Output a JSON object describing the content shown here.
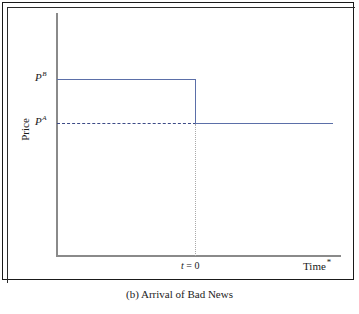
{
  "figure": {
    "caption": "(b) Arrival of Bad News",
    "frame_color": "#1a1a1a"
  },
  "axes": {
    "ylabel": "Price",
    "xlabel": "Time",
    "xlabel_superscript": "*",
    "axis_color": "#8a8a8a"
  },
  "labels": {
    "p_high_base": "P",
    "p_high_sup": "B",
    "p_low_base": "P",
    "p_low_sup": "A",
    "event_var": "t",
    "event_eq": " = 0"
  },
  "chart_data": {
    "type": "line",
    "title": "(b) Arrival of Bad News",
    "xlabel": "Time*",
    "ylabel": "Price",
    "grid": false,
    "legend": null,
    "xlim": [
      0,
      1
    ],
    "ylim": [
      0,
      1
    ],
    "annotations": [
      {
        "text": "P^B",
        "role": "y-tick-label",
        "value_label": "P^B"
      },
      {
        "text": "P^A",
        "role": "y-tick-label",
        "value_label": "P^A"
      },
      {
        "text": "t = 0",
        "role": "x-tick-label",
        "x": 0.49
      },
      {
        "text": "Time*",
        "role": "axis-title-x"
      },
      {
        "text": "Price",
        "role": "axis-title-y"
      }
    ],
    "series": [
      {
        "name": "Price path",
        "color": "#5b6fa8",
        "style": "solid-step-down",
        "points": [
          {
            "x": 0.0,
            "y": "P^B"
          },
          {
            "x": 0.49,
            "y": "P^B"
          },
          {
            "x": 0.49,
            "y": "P^A"
          },
          {
            "x": 1.0,
            "y": "P^A"
          }
        ],
        "description": "Price stays at the high level P^B until t = 0, then jumps down discontinuously to the lower level P^A and remains flat."
      },
      {
        "name": "P^A reference",
        "color": "#3c4a86",
        "style": "dashed",
        "points": [
          {
            "x": 0.0,
            "y": "P^A"
          },
          {
            "x": 0.49,
            "y": "P^A"
          }
        ],
        "description": "Horizontal dashed reference line marking the post-news price level P^A."
      },
      {
        "name": "t = 0 guide",
        "color": "#a9a9a9",
        "style": "dotted",
        "points": [
          {
            "x": 0.49,
            "y": "P^A"
          },
          {
            "x": 0.49,
            "y": 0.0
          }
        ],
        "description": "Vertical dotted guide dropping from the post-jump price to the time axis at t = 0."
      }
    ]
  }
}
